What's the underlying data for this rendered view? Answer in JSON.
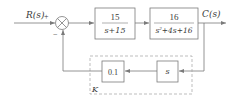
{
  "diagram": {
    "type": "control-system-block-diagram",
    "colors": {
      "line": "#7a7a7a",
      "text": "#3a3a3a",
      "dashed": "#a0a0a0",
      "background": "#ffffff"
    },
    "input": {
      "label": "R(s)"
    },
    "output": {
      "label": "C(s)"
    },
    "summing_junction": {
      "plus_sign": "+",
      "minus_sign": "−"
    },
    "forward_blocks": [
      {
        "numerator": "15",
        "denominator": "s+15"
      },
      {
        "numerator": "16",
        "denominator_base": "s",
        "denominator_exp": "2",
        "denominator_rest": "+4s+16"
      }
    ],
    "feedback_blocks": [
      {
        "label": "s"
      },
      {
        "label": "0.1"
      }
    ],
    "feedback_group": {
      "label": "K"
    }
  }
}
